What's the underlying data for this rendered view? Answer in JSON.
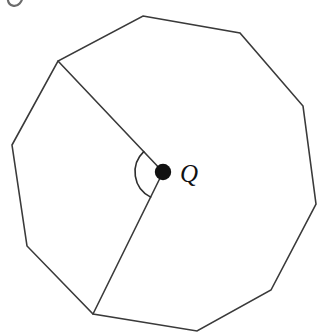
{
  "figure": {
    "background_color": "#ffffff",
    "stroke_color": "#3a3a3a",
    "label_color": "#111111",
    "width": 326,
    "height": 334
  },
  "labels": {
    "center_point": "Q"
  },
  "chart_data": {
    "type": "diagram",
    "shape": "decagon",
    "sides": 10,
    "center": {
      "name": "Q",
      "x": 163,
      "y": 172
    },
    "vertices": [
      {
        "index": 0,
        "x": 143,
        "y": 16
      },
      {
        "index": 1,
        "x": 240,
        "y": 33
      },
      {
        "index": 2,
        "x": 303,
        "y": 106
      },
      {
        "index": 3,
        "x": 316,
        "y": 204
      },
      {
        "index": 4,
        "x": 271,
        "y": 290
      },
      {
        "index": 5,
        "x": 197,
        "y": 331
      },
      {
        "index": 6,
        "x": 93,
        "y": 314
      },
      {
        "index": 7,
        "x": 27,
        "y": 246
      },
      {
        "index": 8,
        "x": 12,
        "y": 145
      },
      {
        "index": 9,
        "x": 58,
        "y": 61
      }
    ],
    "radii": [
      {
        "from": "Q",
        "to_vertex_index": 9
      },
      {
        "from": "Q",
        "to_vertex_index": 6
      }
    ],
    "angle_marker": {
      "at": "Q",
      "between_vertices": [
        9,
        6
      ],
      "radius_px": 28,
      "drawn": true
    },
    "grid": false,
    "legend": false
  }
}
